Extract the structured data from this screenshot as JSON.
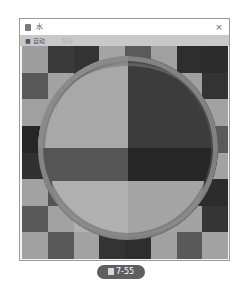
{
  "window": {
    "title": "水",
    "title_icon": "app-icon",
    "close_glyph": "×"
  },
  "menubar": {
    "items": [
      {
        "label": "■ 自动",
        "enabled": true
      },
      {
        "label": "暂停",
        "enabled": false
      }
    ]
  },
  "scene": {
    "checkerboard": {
      "rows": 8,
      "cols": 8,
      "cells": [
        [
          "#9e9e9e",
          "#3a3a3a",
          "#333333",
          "#a4a4a4",
          "#5a5a5a",
          "#a0a0a0",
          "#2e2e2e",
          "#2c2c2c"
        ],
        [
          "#595959",
          "#a2a2a2",
          "#353535",
          "#3a3a3a",
          "#a0a0a0",
          "#a2a2a2",
          "#a0a0a0",
          "#333333"
        ],
        [
          "#a0a0a0",
          "#9e9e9e",
          "#a6a6a6",
          "#a8a8a8",
          "#3a3a3a",
          "#393939",
          "#a2a2a2",
          "#a2a2a2"
        ],
        [
          "#262626",
          "#a8a8a8",
          "#a8a8a8",
          "#a8a8a8",
          "#3c3c3c",
          "#3c3c3c",
          "#3c3c3c",
          "#5a5a5a"
        ],
        [
          "#303030",
          "#555555",
          "#555555",
          "#555555",
          "#262626",
          "#262626",
          "#262626",
          "#a2a2a2"
        ],
        [
          "#a2a2a2",
          "#555555",
          "#555555",
          "#555555",
          "#262626",
          "#262626",
          "#2a2a2a",
          "#2c2c2c"
        ],
        [
          "#595959",
          "#a2a2a2",
          "#b0b0b0",
          "#b0b0b0",
          "#a4a4a4",
          "#a4a4a4",
          "#a2a2a2",
          "#353535"
        ],
        [
          "#a0a0a0",
          "#595959",
          "#a2a2a2",
          "#333333",
          "#2e2e2e",
          "#a0a0a0",
          "#595959",
          "#a2a2a2"
        ]
      ]
    },
    "sphere": {
      "quadrants": {
        "top_left": "#a8a8a8",
        "top_right": "#3c3c3c",
        "bottom_left": "#555555",
        "bottom_right": "#262626"
      }
    }
  },
  "caption": {
    "label": "7-55",
    "prefix_icon": "figure-icon",
    "bg": "#5f5f5f"
  }
}
